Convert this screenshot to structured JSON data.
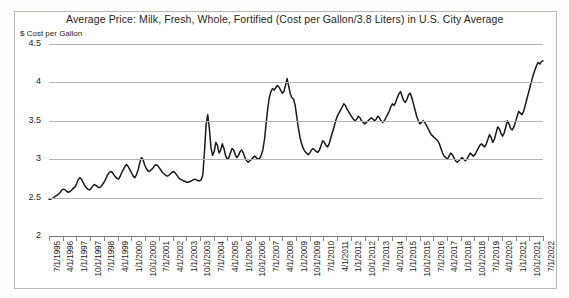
{
  "chart_data": {
    "type": "line",
    "title": "Average Price: Milk, Fresh, Whole, Fortified (Cost per Gallon/3.8 Liters) in U.S. City Average",
    "xlabel": "",
    "ylabel": "$ Cost per Gallon",
    "ylim": [
      2,
      4.5
    ],
    "ytick_labels": [
      "4.5",
      "4",
      "3.5",
      "3",
      "2.5",
      "2"
    ],
    "ytick_values": [
      4.5,
      4,
      3.5,
      3,
      2.5,
      2
    ],
    "grid": true,
    "legend": "none",
    "line_color": "#1a1a1a",
    "xtick_labels": [
      "7/1/1995",
      "4/1/1996",
      "1/1/1997",
      "10/1/1997",
      "7/1/1998",
      "4/1/1999",
      "1/1/2000",
      "10/1/2000",
      "7/1/2001",
      "4/1/2002",
      "1/1/2003",
      "10/1/2003",
      "7/1/2004",
      "4/1/2005",
      "1/1/2006",
      "10/1/2006",
      "7/1/2007",
      "4/1/2008",
      "1/1/2009",
      "10/1/2009",
      "7/1/2010",
      "4/1/2011",
      "1/1/2012",
      "10/1/2012",
      "7/1/2013",
      "4/1/2014",
      "1/1/2015",
      "10/1/2015",
      "7/1/2016",
      "4/1/2017",
      "1/1/2018",
      "10/1/2018",
      "7/1/2019",
      "4/1/2020",
      "1/1/2021",
      "10/1/2021",
      "7/1/2022"
    ],
    "x_start": "7/1/1995",
    "x_end": "7/1/2022",
    "series": [
      {
        "name": "Average Price: Milk, Fresh, Whole, Fortified",
        "values": [
          2.48,
          2.48,
          2.49,
          2.5,
          2.52,
          2.53,
          2.55,
          2.57,
          2.6,
          2.61,
          2.6,
          2.58,
          2.57,
          2.58,
          2.6,
          2.62,
          2.64,
          2.68,
          2.73,
          2.76,
          2.74,
          2.7,
          2.66,
          2.63,
          2.61,
          2.6,
          2.62,
          2.65,
          2.67,
          2.66,
          2.64,
          2.63,
          2.64,
          2.67,
          2.7,
          2.74,
          2.79,
          2.82,
          2.84,
          2.83,
          2.8,
          2.77,
          2.75,
          2.74,
          2.78,
          2.83,
          2.87,
          2.91,
          2.93,
          2.9,
          2.86,
          2.82,
          2.78,
          2.76,
          2.8,
          2.86,
          2.95,
          3.02,
          3.0,
          2.93,
          2.88,
          2.85,
          2.84,
          2.86,
          2.88,
          2.91,
          2.93,
          2.92,
          2.89,
          2.86,
          2.83,
          2.81,
          2.79,
          2.78,
          2.79,
          2.81,
          2.83,
          2.84,
          2.82,
          2.79,
          2.76,
          2.74,
          2.73,
          2.72,
          2.71,
          2.7,
          2.7,
          2.71,
          2.72,
          2.73,
          2.74,
          2.73,
          2.72,
          2.72,
          2.73,
          2.8,
          3.1,
          3.45,
          3.58,
          3.4,
          3.15,
          3.05,
          3.1,
          3.22,
          3.18,
          3.08,
          3.12,
          3.2,
          3.14,
          3.05,
          3.0,
          3.02,
          3.08,
          3.14,
          3.12,
          3.06,
          3.02,
          3.05,
          3.1,
          3.12,
          3.08,
          3.02,
          2.98,
          2.96,
          2.98,
          3.0,
          3.02,
          3.04,
          3.02,
          3.0,
          3.01,
          3.05,
          3.12,
          3.25,
          3.45,
          3.65,
          3.8,
          3.88,
          3.92,
          3.9,
          3.93,
          3.96,
          3.94,
          3.9,
          3.86,
          3.88,
          3.96,
          4.05,
          3.95,
          3.85,
          3.8,
          3.78,
          3.7,
          3.55,
          3.4,
          3.28,
          3.2,
          3.14,
          3.1,
          3.08,
          3.06,
          3.08,
          3.12,
          3.14,
          3.12,
          3.1,
          3.09,
          3.12,
          3.18,
          3.24,
          3.22,
          3.18,
          3.16,
          3.2,
          3.28,
          3.35,
          3.42,
          3.5,
          3.56,
          3.6,
          3.64,
          3.68,
          3.72,
          3.7,
          3.65,
          3.62,
          3.58,
          3.55,
          3.52,
          3.5,
          3.52,
          3.56,
          3.54,
          3.5,
          3.48,
          3.46,
          3.48,
          3.5,
          3.52,
          3.54,
          3.52,
          3.5,
          3.52,
          3.56,
          3.54,
          3.5,
          3.48,
          3.5,
          3.54,
          3.58,
          3.62,
          3.68,
          3.72,
          3.7,
          3.74,
          3.8,
          3.85,
          3.88,
          3.82,
          3.76,
          3.74,
          3.78,
          3.84,
          3.86,
          3.8,
          3.72,
          3.64,
          3.56,
          3.5,
          3.46,
          3.48,
          3.5,
          3.48,
          3.44,
          3.4,
          3.36,
          3.32,
          3.3,
          3.28,
          3.26,
          3.24,
          3.2,
          3.14,
          3.08,
          3.04,
          3.02,
          3.0,
          3.04,
          3.08,
          3.06,
          3.02,
          2.98,
          2.96,
          2.98,
          3.0,
          3.02,
          3.0,
          2.98,
          3.0,
          3.04,
          3.08,
          3.06,
          3.04,
          3.06,
          3.1,
          3.14,
          3.18,
          3.2,
          3.18,
          3.16,
          3.2,
          3.26,
          3.32,
          3.28,
          3.22,
          3.26,
          3.34,
          3.42,
          3.4,
          3.34,
          3.3,
          3.34,
          3.42,
          3.5,
          3.46,
          3.4,
          3.38,
          3.42,
          3.48,
          3.56,
          3.62,
          3.6,
          3.58,
          3.62,
          3.7,
          3.78,
          3.86,
          3.94,
          4.02,
          4.1,
          4.16,
          4.22,
          4.26,
          4.24,
          4.27,
          4.28
        ]
      }
    ]
  }
}
